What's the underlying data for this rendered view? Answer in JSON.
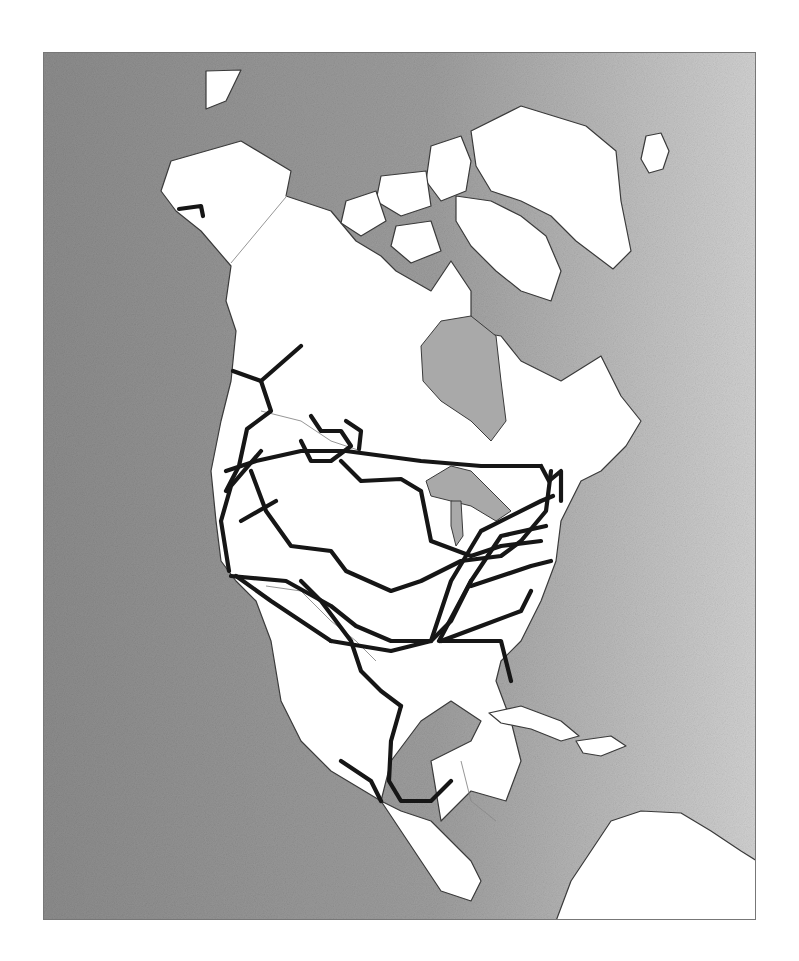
{
  "figure": {
    "type": "map",
    "region": "North America",
    "frame": {
      "x": 43,
      "y": 52,
      "width": 713,
      "height": 868
    },
    "colors": {
      "page": "#ffffff",
      "ocean_dark": "#8c8c8c",
      "ocean_light": "#d2d2d2",
      "land": "#ffffff",
      "inland_water": "#a9a9a9",
      "coastline": "#3a3a3a",
      "political_border": "#8a8a8a",
      "network_line": "#161616"
    },
    "landmasses": [
      {
        "name": "north-america-mainland",
        "points": "170,160 205,150 240,140 290,170 285,195 330,210 355,240 380,255 395,270 430,290 450,260 470,290 470,330 500,335 520,360 560,380 600,355 620,395 640,420 625,445 600,470 580,480 560,520 555,560 540,600 520,640 500,660 495,680 510,720 520,760 505,800 470,790 440,820 430,760 470,740 480,720 450,700 420,720 390,760 380,800 400,810 430,820 450,840 470,860 480,880 470,900 440,890 420,860 380,800 330,770 300,740 280,700 270,640 255,600 235,580 220,560 215,520 210,470 220,420 230,380 235,330 225,300 230,265 200,230 175,210 160,190"
      },
      {
        "name": "greenland",
        "points": "470,130 520,105 585,125 615,150 620,200 630,250 612,268 575,240 550,215 520,200 490,190 475,165"
      },
      {
        "name": "iceland",
        "points": "645,135 660,132 668,150 662,168 648,172 640,158"
      },
      {
        "name": "baffin-island",
        "points": "455,195 490,200 520,215 545,235 560,270 550,300 520,290 495,270 470,245 455,220"
      },
      {
        "name": "ellesmere-island",
        "points": "430,145 460,135 470,160 465,190 440,200 425,180"
      },
      {
        "name": "arctic-island-1",
        "points": "380,175 425,170 430,205 400,215 375,200"
      },
      {
        "name": "arctic-island-2",
        "points": "345,200 375,190 385,220 360,235 340,222"
      },
      {
        "name": "arctic-island-3",
        "points": "395,225 430,220 440,250 410,262 390,245"
      },
      {
        "name": "wrangel-island",
        "points": "205,70 240,69 225,100 205,108"
      },
      {
        "name": "cuba",
        "points": "488,712 520,705 560,720 578,735 560,740 530,728 500,722"
      },
      {
        "name": "hispaniola",
        "points": "575,740 610,735 625,745 600,755 582,752"
      },
      {
        "name": "south-america-north",
        "points": "555,920 570,880 590,850 610,820 640,810 680,812 710,830 740,850 756,860 756,920"
      }
    ],
    "inland_water": [
      {
        "name": "hudson-bay",
        "points": "420,345 440,320 470,315 495,335 500,380 505,420 490,440 470,420 440,400 422,380"
      },
      {
        "name": "great-lakes",
        "points": "425,480 450,465 470,470 490,490 510,510 495,520 470,505 450,500 430,495"
      },
      {
        "name": "lake-michigan",
        "points": "450,500 460,500 462,535 455,545 450,525"
      }
    ],
    "borders": [
      {
        "name": "alaska-canada-border",
        "points": "290,190 230,262"
      },
      {
        "name": "canada-us-border",
        "points": "260,410 300,420 330,440 360,450"
      },
      {
        "name": "us-mexico-border",
        "points": "265,585 300,590 330,620 355,640 375,660"
      },
      {
        "name": "central-america-borders",
        "points": "460,760 470,800 495,820"
      }
    ],
    "network": [
      {
        "name": "alaska-spur",
        "points": "178,208 200,205 202,215"
      },
      {
        "name": "yukon-branch",
        "points": "232,370 260,380 300,345"
      },
      {
        "name": "bc-trunk",
        "points": "260,380 270,410 246,428 238,465 225,490"
      },
      {
        "name": "west-coast-trunk",
        "points": "225,470 255,460 300,450 345,450 420,460 480,465 540,465"
      },
      {
        "name": "prairie-loop",
        "points": "310,415 320,430 340,430 350,445 330,460 310,460 300,440"
      },
      {
        "name": "alberta-branch",
        "points": "345,420 360,430 358,448"
      },
      {
        "name": "saskatchewan-line",
        "points": "340,460 360,480 400,478 420,490 430,540 470,555 500,545 540,540"
      },
      {
        "name": "california-trunk",
        "points": "260,450 230,485 220,520 228,570"
      },
      {
        "name": "sierra-line",
        "points": "250,470 265,510 290,545 330,550 345,570 390,590 420,580 460,560 500,555 520,540 545,510 550,470"
      },
      {
        "name": "northern-plains",
        "points": "275,500 240,520"
      },
      {
        "name": "central-line",
        "points": "230,575 285,580 330,605 355,625 390,640 430,640"
      },
      {
        "name": "southern-california",
        "points": "235,575 270,600 300,620 330,640"
      },
      {
        "name": "texas-line",
        "points": "300,580 320,600 350,640 360,670 380,690 400,705"
      },
      {
        "name": "gulf-line",
        "points": "330,640 390,650 430,640 450,620 470,580"
      },
      {
        "name": "east-trunk-1",
        "points": "430,640 450,580 480,530 540,500 552,495"
      },
      {
        "name": "east-trunk-2",
        "points": "438,640 470,580 500,535 545,525"
      },
      {
        "name": "southeast-line",
        "points": "440,640 480,625 520,610 530,590"
      },
      {
        "name": "appalachian-line",
        "points": "470,585 500,575 530,565 550,560"
      },
      {
        "name": "florida-line",
        "points": "440,640 500,640 510,680"
      },
      {
        "name": "mexico-gulf-coast",
        "points": "400,705 390,740 388,780 400,800 430,800 450,780"
      },
      {
        "name": "mexico-interior",
        "points": "340,760 370,780 380,800"
      },
      {
        "name": "northeast-line",
        "points": "540,465 548,480 560,470 560,500"
      }
    ]
  }
}
